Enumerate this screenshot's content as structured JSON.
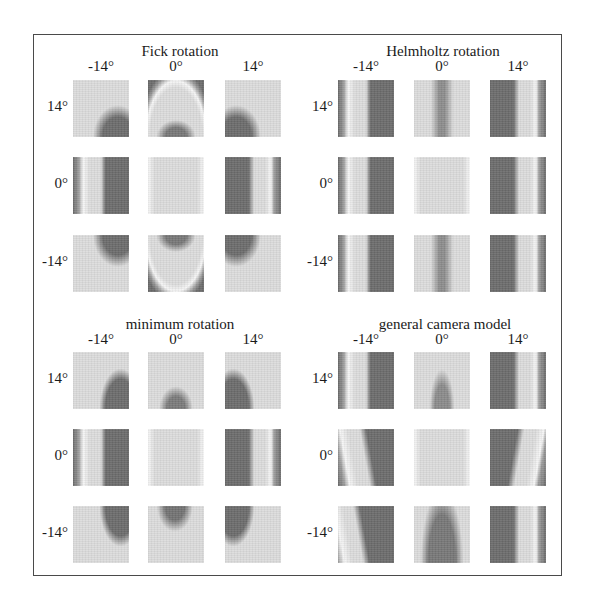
{
  "figure": {
    "colors": {
      "dark": "#6b6b6b",
      "mid": "#9a9a9a",
      "light": "#dcdcdc",
      "bright": "#f6f6f6",
      "border": "#4a4a4a"
    },
    "blocks": [
      {
        "id": "fick",
        "title": "Fick rotation",
        "col_labels": [
          "-14°",
          "0°",
          "14°"
        ],
        "row_labels": [
          "14°",
          "0°",
          "-14°"
        ],
        "panels": [
          [
            "fick-arc-left-up",
            "fick-arc-center-up",
            "fick-arc-right-up"
          ],
          [
            "bands-left",
            "flat",
            "bands-right"
          ],
          [
            "fick-arc-left-down",
            "fick-arc-center-down",
            "fick-arc-right-down"
          ]
        ]
      },
      {
        "id": "helmholtz",
        "title": "Helmholtz rotation",
        "col_labels": [
          "-14°",
          "0°",
          "14°"
        ],
        "row_labels": [
          "14°",
          "0°",
          "-14°"
        ],
        "panels": [
          [
            "bands-left",
            "center-stripe",
            "bands-right"
          ],
          [
            "bands-left",
            "flat",
            "bands-right"
          ],
          [
            "bands-left",
            "center-stripe",
            "bands-right"
          ]
        ]
      },
      {
        "id": "minimum",
        "title": "minimum rotation",
        "col_labels": [
          "-14°",
          "0°",
          "14°"
        ],
        "row_labels": [
          "14°",
          "0°",
          "-14°"
        ],
        "panels": [
          [
            "min-left-up",
            "blob-bottom",
            "min-right-up"
          ],
          [
            "bands-left",
            "flat",
            "bands-right"
          ],
          [
            "min-left-down",
            "blob-top",
            "min-right-down"
          ]
        ]
      },
      {
        "id": "general",
        "title": "general camera model",
        "col_labels": [
          "-14°",
          "0°",
          "14°"
        ],
        "row_labels": [
          "14°",
          "0°",
          "-14°"
        ],
        "panels": [
          [
            "bands-left",
            "cone-up",
            "bands-right"
          ],
          [
            "bands-left-slant",
            "flat",
            "bands-right-slant"
          ],
          [
            "bands-left-wide",
            "cone-wide",
            "bands-right"
          ]
        ]
      }
    ]
  }
}
